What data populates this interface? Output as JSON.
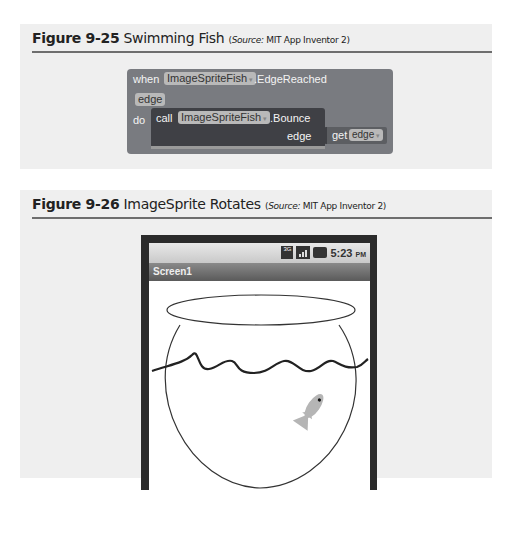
{
  "figures": [
    {
      "number": "Figure 9-25",
      "title": "Swimming Fish",
      "source_label": "Source:",
      "source": "MIT App Inventor 2",
      "blocks": {
        "event_keyword": "when",
        "component": "ImageSpriteFish",
        "event": ".EdgeReached",
        "param": "edge",
        "do_keyword": "do",
        "call_keyword": "call",
        "call_component": "ImageSpriteFish",
        "method": ".Bounce",
        "arg_label": "edge",
        "get_keyword": "get",
        "get_var": "edge",
        "dropdown_glyph": "▾"
      }
    },
    {
      "number": "Figure 9-26",
      "title": "ImageSprite Rotates",
      "source_label": "Source:",
      "source": "MIT App Inventor 2",
      "phone": {
        "network": "3G",
        "time": "5:23",
        "ampm": "PM",
        "screen_title": "Screen1"
      }
    }
  ],
  "colors": {
    "panel_bg": "#efefef",
    "rule": "#6e6e6e",
    "block_outer": "#797b80",
    "block_inner": "#3f4045",
    "pill": "#b9b9b9",
    "fish": "#b5b5b5"
  }
}
